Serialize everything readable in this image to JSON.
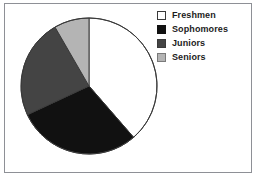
{
  "chart_data": {
    "type": "pie",
    "title": "",
    "subtitle": "",
    "xlabel": "",
    "ylabel": "",
    "grid": false,
    "legend_position": "right",
    "start_angle_deg": 0,
    "direction": "clockwise",
    "categories": [
      "Freshmen",
      "Sophomores",
      "Juniors",
      "Seniors"
    ],
    "values": [
      38.6,
      29.4,
      23.6,
      8.4
    ],
    "units": "percent",
    "slice_angles_deg": [
      139,
      106,
      85,
      30
    ],
    "boundary_angles_deg": [
      0,
      139,
      245,
      330,
      360
    ],
    "colors": [
      "#ffffff",
      "#111111",
      "#444444",
      "#b4b4b4"
    ],
    "slice_border_color": "#3a3a3a",
    "annotations": [],
    "data_labels_shown": false
  },
  "figure": {
    "background_color": "#ffffff",
    "frame_color": "#8e9096",
    "pie": {
      "center_x": 89,
      "center_y": 86,
      "radius": 68,
      "outline_color": "#3a3a3a"
    }
  },
  "legend": {
    "items": [
      {
        "label": "Freshmen",
        "color": "#ffffff",
        "border_color": "#3a3a3a"
      },
      {
        "label": "Sophomores",
        "color": "#111111",
        "border_color": "#111111"
      },
      {
        "label": "Juniors",
        "color": "#444444",
        "border_color": "#3a3a3a"
      },
      {
        "label": "Seniors",
        "color": "#b4b4b4",
        "border_color": "#7a7a7a"
      }
    ]
  }
}
